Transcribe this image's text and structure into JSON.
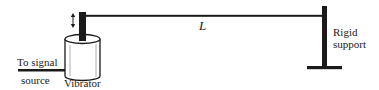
{
  "diagram": {
    "type": "vibrating-string-apparatus",
    "labels": {
      "length": "L",
      "vibrator": "Vibrator",
      "signal_line1": "To signal",
      "signal_line2": "source",
      "support_line1": "Rigid",
      "support_line2": "support"
    },
    "components": [
      {
        "name": "vibrator",
        "description": "Cylindrical vibrator with vertical driving rod"
      },
      {
        "name": "oscillation-arrow",
        "description": "Double-headed vertical arrow indicating rod motion"
      },
      {
        "name": "string",
        "description": "Horizontal string of length L"
      },
      {
        "name": "rigid-support",
        "description": "Inverted-T rigid support post"
      },
      {
        "name": "signal-wire",
        "description": "Wire from vibrator to signal source"
      }
    ],
    "colors": {
      "ink": "#1a1a1a",
      "background": "#ffffff"
    }
  }
}
